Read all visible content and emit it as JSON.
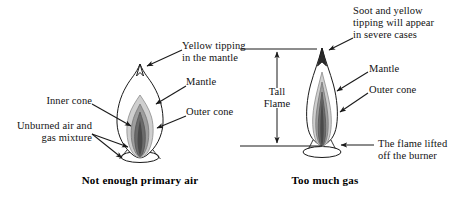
{
  "figure": {
    "background": "#ffffff",
    "ink": "#1a1a1a"
  },
  "panels": [
    {
      "id": "left",
      "caption": "Not enough primary air",
      "flame": {
        "kind": "short-split-tip",
        "seated_on_burner": true,
        "layers": [
          "outer cone",
          "mantle",
          "inner cone",
          "unburned air and gas mixture"
        ],
        "shades": {
          "outer_cone": "#ffffff",
          "mantle_outer": "#c9c9c9",
          "mantle_inner": "#9a9a9a",
          "inner_cone": "#6f6f6f",
          "core": "#4a4a4a"
        }
      },
      "labels": [
        {
          "id": "yellow-tipping",
          "text": "Yellow tipping\nin the mantle",
          "align": "left"
        },
        {
          "id": "mantle",
          "text": "Mantle",
          "align": "left"
        },
        {
          "id": "outer-cone",
          "text": "Outer cone",
          "align": "left"
        },
        {
          "id": "inner-cone",
          "text": "Inner cone",
          "align": "right"
        },
        {
          "id": "unburned-mixture",
          "text": "Unburned air and\ngas mixture",
          "align": "right"
        }
      ]
    },
    {
      "id": "right",
      "caption": "Too much gas",
      "flame": {
        "kind": "tall-narrow-sooty-tip",
        "seated_on_burner": false,
        "layers": [
          "outer cone",
          "mantle",
          "inner cone"
        ],
        "shades": {
          "outer_cone": "#ffffff",
          "mantle_outer": "#c9c9c9",
          "mantle_inner": "#9a9a9a",
          "inner_cone": "#6f6f6f",
          "soot_tip": "#2a2a2a"
        }
      },
      "dimension": {
        "id": "tall-flame-dimension",
        "text": "Tall\nFlame",
        "style": "double-headed vertical arrow between two horizontal extension lines"
      },
      "labels": [
        {
          "id": "soot-yellow-tipping",
          "text": "Soot and yellow\ntipping will appear\nin severe cases",
          "align": "left"
        },
        {
          "id": "mantle",
          "text": "Mantle",
          "align": "left"
        },
        {
          "id": "outer-cone",
          "text": "Outer cone",
          "align": "left"
        },
        {
          "id": "flame-lifted",
          "text": "The flame lifted\noff the burner",
          "align": "left"
        }
      ]
    }
  ],
  "text": {
    "left": {
      "yellow_tipping_line1": "Yellow tipping",
      "yellow_tipping_line2": "in the mantle",
      "mantle": "Mantle",
      "outer_cone": "Outer cone",
      "inner_cone": "Inner cone",
      "unburned_line1": "Unburned air and",
      "unburned_line2": "gas mixture",
      "caption": "Not enough primary air"
    },
    "right": {
      "soot_line1": "Soot and yellow",
      "soot_line2": "tipping will appear",
      "soot_line3": "in severe cases",
      "mantle": "Mantle",
      "outer_cone": "Outer cone",
      "lifted_line1": "The flame lifted",
      "lifted_line2": "off the burner",
      "tall_line1": "Tall",
      "tall_line2": "Flame",
      "caption": "Too much gas"
    }
  }
}
